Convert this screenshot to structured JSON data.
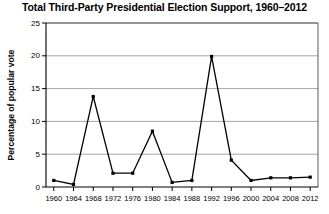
{
  "chart_data": {
    "type": "line",
    "title": "Total Third-Party Presidential Election Support, 1960–2012",
    "xlabel": "",
    "ylabel": "Percentage of popular vote",
    "categories": [
      "1960",
      "1964",
      "1968",
      "1972",
      "1976",
      "1980",
      "1984",
      "1988",
      "1992",
      "1996",
      "2000",
      "2004",
      "2008",
      "2012"
    ],
    "x": [
      1960,
      1964,
      1968,
      1972,
      1976,
      1980,
      1984,
      1988,
      1992,
      1996,
      2000,
      2004,
      2008,
      2012
    ],
    "values": [
      1.0,
      0.4,
      13.8,
      2.1,
      2.1,
      8.5,
      0.7,
      1.0,
      19.9,
      4.1,
      1.0,
      1.4,
      1.4,
      1.5
    ],
    "series": [
      {
        "name": "Total third-party support",
        "values": [
          1.0,
          0.4,
          13.8,
          2.1,
          2.1,
          8.5,
          0.7,
          1.0,
          19.9,
          4.1,
          1.0,
          1.4,
          1.4,
          1.5
        ]
      }
    ],
    "ylim": [
      0,
      25
    ],
    "yticks": [
      0,
      5,
      10,
      15,
      20,
      25
    ],
    "ytick_labels": [
      "0",
      "5",
      "10",
      "15",
      "20",
      "25"
    ],
    "grid": true,
    "grid_axis": "y",
    "legend": false,
    "legend_position": "none",
    "marker": "square",
    "line_color": "#000000",
    "grid_color": "#8d8d8d",
    "background_color": "#ffffff"
  }
}
